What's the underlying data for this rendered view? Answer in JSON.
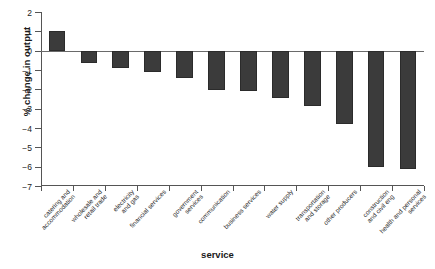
{
  "chart_data": {
    "type": "bar",
    "title": "",
    "xlabel": "service",
    "ylabel": "% change in output",
    "ylim": [
      -7,
      2
    ],
    "yticks": [
      2,
      1,
      0,
      -1,
      -2,
      -3,
      -4,
      -5,
      -6,
      -7
    ],
    "ytick_labels": [
      "2",
      "1",
      "0",
      "−1",
      "−2",
      "−3",
      "−4",
      "−5",
      "−6",
      "−7"
    ],
    "grid": false,
    "legend": "none",
    "bar_color": "#3b3b3b",
    "categories": [
      "catering and accommodation",
      "wholesale and retail trade",
      "electricity and gas",
      "financial services",
      "government services",
      "communication",
      "business services",
      "water supply",
      "transportation and storage",
      "other producers",
      "construction and civil eng",
      "health and personal services"
    ],
    "category_lines": [
      [
        "catering and",
        "accommodation"
      ],
      [
        "wholesale and",
        "retail trade"
      ],
      [
        "electricity",
        "and gas"
      ],
      [
        "financial services"
      ],
      [
        "government",
        "services"
      ],
      [
        "communication"
      ],
      [
        "business services"
      ],
      [
        "water supply"
      ],
      [
        "transportation",
        "and storage"
      ],
      [
        "other producers"
      ],
      [
        "construction",
        "and civil eng"
      ],
      [
        "health and personal",
        "services"
      ]
    ],
    "values": [
      1.0,
      -0.65,
      -0.9,
      -1.1,
      -1.4,
      -2.05,
      -2.1,
      -2.45,
      -2.85,
      -3.8,
      -6.0,
      -6.1
    ]
  }
}
